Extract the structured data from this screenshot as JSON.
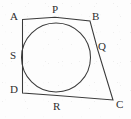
{
  "figure": {
    "background_color": "#fdfdfd",
    "stroke_color": "#3a3a3a",
    "label_color": "#2e2e2e",
    "canvas": {
      "width": 131,
      "height": 119
    },
    "circle": {
      "cx": 56,
      "cy": 57.5,
      "r": 34.5
    },
    "vertices": [
      {
        "id": "A",
        "label": "A",
        "x": 22.5,
        "y": 19.5,
        "label_x": 10,
        "label_y": 11
      },
      {
        "id": "B",
        "label": "B",
        "x": 90.0,
        "y": 21.0,
        "label_x": 92,
        "label_y": 11
      },
      {
        "id": "C",
        "label": "C",
        "x": 113.0,
        "y": 100.0,
        "label_x": 116,
        "label_y": 99
      },
      {
        "id": "D",
        "label": "D",
        "x": 22.5,
        "y": 93.0,
        "label_x": 10,
        "label_y": 84
      }
    ],
    "tangent_points": [
      {
        "id": "P",
        "label": "P",
        "side": "AB",
        "x": 55.0,
        "y": 17.2,
        "label_x": 52,
        "label_y": 4
      },
      {
        "id": "Q",
        "label": "Q",
        "side": "BC",
        "x": 97.5,
        "y": 49.0,
        "label_x": 98,
        "label_y": 41
      },
      {
        "id": "R",
        "label": "R",
        "side": "DC",
        "x": 57.0,
        "y": 95.6,
        "label_x": 53,
        "label_y": 101
      },
      {
        "id": "S",
        "label": "S",
        "side": "AD",
        "x": 22.5,
        "y": 56.0,
        "label_x": 10,
        "label_y": 50
      }
    ],
    "edges": [
      {
        "id": "AB",
        "from": "A",
        "to": "B"
      },
      {
        "id": "BC",
        "from": "B",
        "to": "C"
      },
      {
        "id": "CD",
        "from": "C",
        "to": "D"
      },
      {
        "id": "DA",
        "from": "D",
        "to": "A"
      }
    ],
    "paths": {
      "quadrilateral": "M 22.5 19.5 L 55 17.2 L 90 21 L 97.5 49 L 113 100 L 57 95.6 L 22.5 93 Z"
    }
  }
}
